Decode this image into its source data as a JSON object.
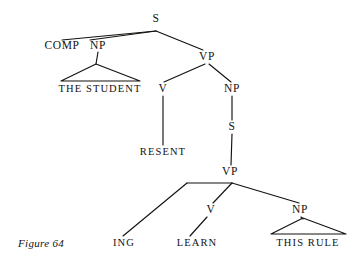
{
  "figure": {
    "caption": "Figure 64",
    "type": "syntactic-tree-diagram",
    "ink_color": "#14120f",
    "background_color": "#ffffff"
  },
  "nodes": {
    "s_root": {
      "label": "S",
      "x": 156,
      "y": 19
    },
    "comp": {
      "label": "COMP",
      "x": 62,
      "y": 46
    },
    "np_subject": {
      "label": "NP",
      "x": 98,
      "y": 46
    },
    "vp_main": {
      "label": "VP",
      "x": 207,
      "y": 57
    },
    "the_student": {
      "label": "THE STUDENT",
      "x": 100,
      "y": 89
    },
    "v_resent": {
      "label": "V",
      "x": 163,
      "y": 89
    },
    "np_object": {
      "label": "NP",
      "x": 232,
      "y": 89
    },
    "resent": {
      "label": "RESENT",
      "x": 163,
      "y": 152
    },
    "s_embedded": {
      "label": "S",
      "x": 232,
      "y": 127
    },
    "vp_embedded": {
      "label": "VP",
      "x": 230,
      "y": 172
    },
    "ing": {
      "label": "ING",
      "x": 124,
      "y": 243
    },
    "v_learn": {
      "label": "V",
      "x": 211,
      "y": 210
    },
    "learn": {
      "label": "LEARN",
      "x": 197,
      "y": 243
    },
    "np_this_rule": {
      "label": "NP",
      "x": 300,
      "y": 210
    },
    "this_rule": {
      "label": "THIS RULE",
      "x": 308,
      "y": 243
    }
  },
  "edges": [
    {
      "name": "s-to-comp",
      "points": "156,31 62,40"
    },
    {
      "name": "s-to-np-subject",
      "points": "156,31 90,40"
    },
    {
      "name": "s-to-vp-main",
      "points": "156,31 203,50"
    },
    {
      "name": "np-subject-to-triangle-apex",
      "points": "98,52 96,64"
    },
    {
      "name": "vp-main-to-v",
      "points": "205,64 164,82"
    },
    {
      "name": "vp-main-to-np-object",
      "points": "209,64 231,82"
    },
    {
      "name": "v-to-resent",
      "points": "163,96 163,145"
    },
    {
      "name": "np-object-to-s-embedded",
      "points": "232,96 232,120"
    },
    {
      "name": "s-embedded-to-vp-embedded",
      "points": "232,134 231,165"
    },
    {
      "name": "vp-embedded-bar-left",
      "points": "232,183 187,183"
    },
    {
      "name": "vp-embedded-to-ing",
      "points": "187,183 123,236"
    },
    {
      "name": "vp-embedded-to-v-learn",
      "points": "232,183 213,203"
    },
    {
      "name": "vp-embedded-to-np-this-rule",
      "points": "232,183 299,203"
    },
    {
      "name": "v-learn-to-learn",
      "points": "207,217 190,236"
    },
    {
      "name": "np-this-rule-to-triangle-apex",
      "points": "301,217 303,219"
    }
  ],
  "triangles": [
    {
      "name": "the-student-triangle",
      "apex_x": 96,
      "apex_y": 64,
      "left_x": 61,
      "right_x": 140,
      "base_y": 81
    },
    {
      "name": "this-rule-triangle",
      "apex_x": 303,
      "apex_y": 218,
      "left_x": 271,
      "right_x": 346,
      "base_y": 234
    }
  ]
}
